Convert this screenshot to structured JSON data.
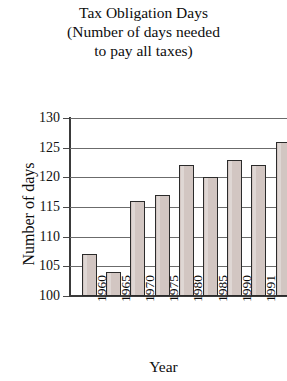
{
  "chart_data": {
    "type": "bar",
    "title": "Tax Obligation Days (Number of days needed to pay all taxes)",
    "title_lines": [
      "Tax Obligation Days",
      "(Number of days needed",
      "to pay all taxes)"
    ],
    "xlabel": "Year",
    "ylabel": "Number of days",
    "categories": [
      "1960",
      "1965",
      "1970",
      "1975",
      "1980",
      "1985",
      "1990",
      "1991",
      "1992"
    ],
    "values": [
      107,
      104,
      116,
      117,
      122,
      120,
      123,
      122,
      126
    ],
    "ylim": [
      100,
      130
    ],
    "ytick_labels": [
      "130",
      "125",
      "120",
      "115",
      "110",
      "105",
      "100"
    ],
    "ytick_values": [
      130,
      125,
      120,
      115,
      110,
      105,
      100
    ],
    "grid": true,
    "legend": false,
    "bar_fill_color": "#d2c6c2",
    "bar_edge_color": "#2b2b2b",
    "grid_color": "#6b6b6b",
    "axis_color": "#3a3a3a",
    "text_color": "#0d0d0d",
    "background_color": "#ffffff",
    "note": "last bar (1992) is clipped at the right edge of the image"
  }
}
